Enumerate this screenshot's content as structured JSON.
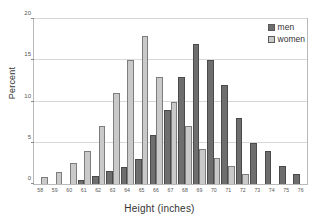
{
  "chart_data": {
    "type": "bar",
    "title": "",
    "xlabel": "Height (inches)",
    "ylabel": "Percent",
    "ylim": [
      0,
      20
    ],
    "yticks": [
      0,
      5,
      10,
      15,
      20
    ],
    "grid": true,
    "legend_position": "top-right",
    "categories": [
      "58",
      "59",
      "60",
      "61",
      "62",
      "63",
      "64",
      "65",
      "66",
      "67",
      "68",
      "69",
      "70",
      "71",
      "72",
      "73",
      "74",
      "75",
      "76"
    ],
    "series": [
      {
        "name": "men",
        "color": "#6e6e6e",
        "values": [
          0,
          0,
          0,
          0.5,
          1,
          1.6,
          2.1,
          3,
          6,
          9,
          13,
          17,
          15,
          12,
          8,
          5,
          4,
          2.2,
          1.2
        ]
      },
      {
        "name": "women",
        "color": "#c9c9c9",
        "values": [
          0.9,
          1.5,
          2.5,
          4,
          7,
          11,
          15,
          18,
          13,
          10,
          7,
          4.2,
          3.2,
          2.2,
          1.2,
          0,
          0,
          0,
          0
        ]
      }
    ]
  },
  "legend": {
    "items": [
      {
        "label": "men",
        "key": "men"
      },
      {
        "label": "women",
        "key": "women"
      }
    ]
  },
  "axes": {
    "x_title": "Height (inches)",
    "y_title": "Percent"
  }
}
